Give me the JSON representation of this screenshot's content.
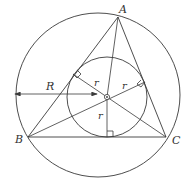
{
  "diagram": {
    "type": "triangle-incircle-circumcircle",
    "colors": {
      "stroke": "#3a3a3a",
      "background": "#ffffff",
      "text": "#333333"
    },
    "vertices": {
      "A": {
        "label": "A",
        "x": 118,
        "y": 17
      },
      "B": {
        "label": "B",
        "x": 28,
        "y": 137
      },
      "C": {
        "label": "C",
        "x": 166,
        "y": 137
      }
    },
    "incenter": {
      "x": 107,
      "y": 97
    },
    "circumcircle": {
      "cx": 98,
      "cy": 95,
      "r": 82,
      "label": "R"
    },
    "incircle": {
      "cx": 107,
      "cy": 97,
      "r": 40
    },
    "radius_labels": {
      "r1": "r",
      "r2": "r",
      "r3": "r"
    },
    "R_label": "R"
  }
}
